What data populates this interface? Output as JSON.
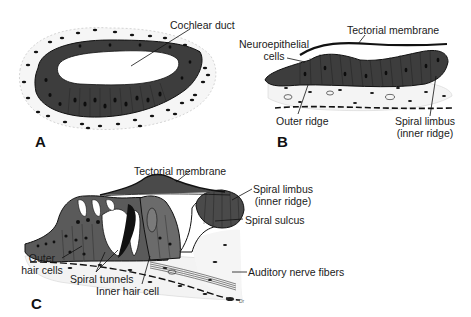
{
  "figure": {
    "panels": [
      {
        "id": "A",
        "letter": "A",
        "labels": {
          "cochlear_duct": "Cochlear duct"
        }
      },
      {
        "id": "B",
        "letter": "B",
        "labels": {
          "tectorial_membrane": "Tectorial membrane",
          "neuroepithelial_line1": "Neuroepithelial",
          "neuroepithelial_line2": "cells",
          "outer_ridge": "Outer ridge",
          "spiral_limbus_line1": "Spiral limbus",
          "spiral_limbus_line2": "(inner ridge)"
        }
      },
      {
        "id": "C",
        "letter": "C",
        "labels": {
          "tectorial_membrane": "Tectorial membrane",
          "spiral_limbus_line1": "Spiral limbus",
          "spiral_limbus_line2": "(inner ridge)",
          "spiral_sulcus": "Spiral sulcus",
          "outer_hair_cells_line1": "Outer",
          "outer_hair_cells_line2": "hair cells",
          "spiral_tunnels": "Spiral tunnels",
          "inner_hair_cell": "Inner hair cell",
          "auditory_nerve_fibers": "Auditory nerve fibers",
          "small_mark": "Dr"
        }
      }
    ],
    "colors": {
      "epithelium": "#3d3d3d",
      "epithelium_light": "#6a6a6a",
      "nucleus": "#111111",
      "mesenchyme": "#f3f3f3",
      "line": "#111111"
    }
  }
}
